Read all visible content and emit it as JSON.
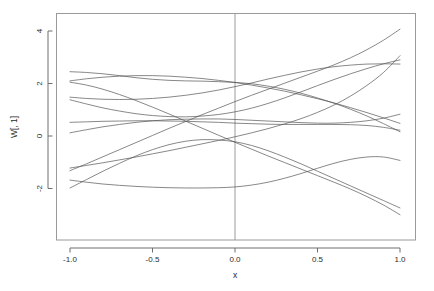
{
  "chart_data": {
    "type": "line",
    "title": "",
    "subtitle": "",
    "xlabel": "x",
    "ylabel": "W[, 1]",
    "xlim": [
      -1.0,
      1.0
    ],
    "ylim": [
      -3.2,
      4.4
    ],
    "grid": false,
    "legend": null,
    "box": true,
    "xticks": [
      -1.0,
      -0.5,
      0.0,
      0.5,
      1.0
    ],
    "xticklabels": [
      "-1.0",
      "-0.5",
      "0.0",
      "0.5",
      "1.0"
    ],
    "yticks": [
      -2,
      0,
      2,
      4
    ],
    "yticklabels": [
      "-2",
      "0",
      "2",
      "4"
    ],
    "annotations": [
      {
        "name": "vertical-reference-line",
        "type": "vline",
        "x": 0.0,
        "color": "#999999"
      }
    ],
    "line_color": "#555555",
    "line_width": 0.7,
    "x": [
      -1.0,
      -0.9,
      -0.8,
      -0.7,
      -0.6,
      -0.5,
      -0.4,
      -0.3,
      -0.2,
      -0.1,
      0.0,
      0.1,
      0.2,
      0.3,
      0.4,
      0.5,
      0.6,
      0.7,
      0.8,
      0.9,
      1.0
    ],
    "series": [
      {
        "name": "curve-1",
        "values": [
          2.45,
          2.42,
          2.37,
          2.3,
          2.22,
          2.16,
          2.12,
          2.1,
          2.09,
          2.07,
          2.04,
          1.99,
          1.9,
          1.78,
          1.63,
          1.45,
          1.25,
          1.02,
          0.76,
          0.47,
          0.16
        ]
      },
      {
        "name": "curve-2",
        "values": [
          2.1,
          2.18,
          2.24,
          2.28,
          2.3,
          2.3,
          2.28,
          2.24,
          2.19,
          2.12,
          2.04,
          1.94,
          1.83,
          1.71,
          1.57,
          1.42,
          1.26,
          1.08,
          0.89,
          0.69,
          0.48
        ]
      },
      {
        "name": "curve-3",
        "values": [
          1.48,
          1.43,
          1.4,
          1.39,
          1.4,
          1.43,
          1.48,
          1.55,
          1.64,
          1.75,
          1.88,
          2.02,
          2.17,
          2.31,
          2.44,
          2.55,
          2.64,
          2.7,
          2.74,
          2.75,
          2.74
        ]
      },
      {
        "name": "curve-4",
        "values": [
          1.38,
          1.22,
          1.07,
          0.95,
          0.85,
          0.78,
          0.74,
          0.73,
          0.76,
          0.82,
          0.92,
          1.06,
          1.24,
          1.45,
          1.68,
          1.92,
          2.15,
          2.37,
          2.57,
          2.75,
          2.9
        ]
      },
      {
        "name": "curve-5",
        "values": [
          0.12,
          0.24,
          0.35,
          0.44,
          0.52,
          0.58,
          0.62,
          0.64,
          0.65,
          0.65,
          0.63,
          0.6,
          0.57,
          0.54,
          0.51,
          0.49,
          0.49,
          0.52,
          0.58,
          0.68,
          0.83
        ]
      },
      {
        "name": "curve-6",
        "values": [
          0.52,
          0.54,
          0.56,
          0.57,
          0.58,
          0.58,
          0.57,
          0.56,
          0.54,
          0.52,
          0.49,
          0.47,
          0.45,
          0.44,
          0.44,
          0.44,
          0.44,
          0.43,
          0.4,
          0.33,
          0.22
        ]
      },
      {
        "name": "curve-7",
        "values": [
          -1.22,
          -1.12,
          -1.02,
          -0.91,
          -0.8,
          -0.68,
          -0.56,
          -0.43,
          -0.3,
          -0.17,
          -0.03,
          0.12,
          0.28,
          0.46,
          0.66,
          0.9,
          1.18,
          1.52,
          1.93,
          2.42,
          3.06
        ]
      },
      {
        "name": "curve-8",
        "values": [
          -1.32,
          -1.06,
          -0.79,
          -0.52,
          -0.25,
          0.02,
          0.29,
          0.55,
          0.81,
          1.06,
          1.31,
          1.55,
          1.78,
          2.01,
          2.24,
          2.47,
          2.71,
          2.98,
          3.29,
          3.65,
          4.07
        ]
      },
      {
        "name": "curve-9",
        "values": [
          -1.68,
          -1.76,
          -1.83,
          -1.88,
          -1.92,
          -1.95,
          -1.97,
          -1.98,
          -1.98,
          -1.97,
          -1.94,
          -1.87,
          -1.76,
          -1.61,
          -1.43,
          -1.23,
          -1.04,
          -0.89,
          -0.8,
          -0.8,
          -0.93
        ]
      },
      {
        "name": "curve-10",
        "values": [
          -1.98,
          -1.66,
          -1.34,
          -1.04,
          -0.76,
          -0.52,
          -0.33,
          -0.2,
          -0.14,
          -0.15,
          -0.22,
          -0.36,
          -0.56,
          -0.8,
          -1.06,
          -1.34,
          -1.62,
          -1.9,
          -2.18,
          -2.46,
          -2.74
        ]
      },
      {
        "name": "curve-11",
        "values": [
          2.05,
          1.94,
          1.78,
          1.58,
          1.35,
          1.1,
          0.84,
          0.57,
          0.3,
          0.03,
          -0.24,
          -0.5,
          -0.76,
          -1.01,
          -1.26,
          -1.51,
          -1.76,
          -2.02,
          -2.31,
          -2.63,
          -3.0
        ]
      }
    ]
  },
  "axes": {
    "x_title": "x",
    "y_title": "W[, 1]"
  }
}
